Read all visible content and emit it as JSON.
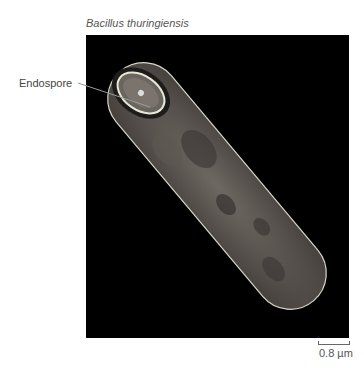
{
  "figure": {
    "title": "Bacillus thuringiensis",
    "label": "Endospore",
    "scale_bar": "0.8 µm",
    "colors": {
      "background": "#000000",
      "cell_outline": "#d8d8c8",
      "cell_fill": "#5a5550",
      "spore_outline": "#e8e8d8"
    }
  }
}
